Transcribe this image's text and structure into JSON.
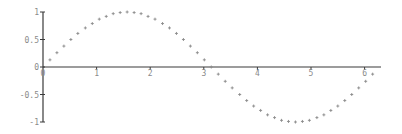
{
  "chart_data": {
    "type": "scatter",
    "title": "",
    "xlabel": "",
    "ylabel": "",
    "function": "sin(x)",
    "xlim": [
      0,
      6.28
    ],
    "ylim": [
      -1,
      1
    ],
    "grid": false,
    "legend": null,
    "x_ticks": [
      "0",
      "1",
      "2",
      "3",
      "4",
      "5",
      "6"
    ],
    "y_ticks": [
      "1",
      "0.5",
      "0",
      "-0.5",
      "-1"
    ],
    "series": [
      {
        "name": "sin(x)",
        "marker": "+",
        "color": "#8a8a8a",
        "x": [
          0.13,
          0.26,
          0.39,
          0.52,
          0.65,
          0.79,
          0.92,
          1.05,
          1.18,
          1.31,
          1.44,
          1.57,
          1.7,
          1.83,
          1.96,
          2.09,
          2.23,
          2.36,
          2.49,
          2.62,
          2.75,
          2.88,
          3.01,
          3.14,
          3.27,
          3.4,
          3.53,
          3.67,
          3.8,
          3.93,
          4.06,
          4.19,
          4.32,
          4.45,
          4.58,
          4.71,
          4.84,
          4.97,
          5.11,
          5.24,
          5.37,
          5.5,
          5.63,
          5.76,
          5.89,
          6.02,
          6.15
        ],
        "y": [
          0.13,
          0.26,
          0.38,
          0.5,
          0.61,
          0.71,
          0.79,
          0.87,
          0.92,
          0.97,
          0.99,
          1.0,
          0.99,
          0.97,
          0.92,
          0.87,
          0.79,
          0.71,
          0.61,
          0.5,
          0.38,
          0.26,
          0.13,
          0.0,
          -0.13,
          -0.26,
          -0.38,
          -0.5,
          -0.61,
          -0.71,
          -0.79,
          -0.87,
          -0.92,
          -0.97,
          -0.99,
          -1.0,
          -0.99,
          -0.97,
          -0.92,
          -0.87,
          -0.79,
          -0.71,
          -0.61,
          -0.5,
          -0.38,
          -0.26,
          -0.13
        ]
      }
    ]
  },
  "colors": {
    "axis": "#3a3a3a",
    "tick_label": "#8a8a8a",
    "marker": "#8a8a8a"
  }
}
